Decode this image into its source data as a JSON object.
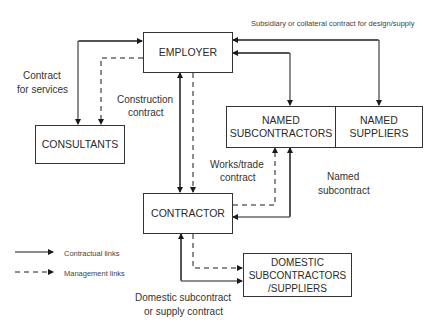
{
  "diagram": {
    "nodes": {
      "employer": "EMPLOYER",
      "consultants": "CONSULTANTS",
      "named_subcontractors": "NAMED\nSUBCONTRACTORS",
      "named_suppliers": "NAMED\nSUPPLIERS",
      "contractor": "CONTRACTOR",
      "domestic": "DOMESTIC\nSUBCONTRACTORS\n/SUPPLIERS"
    },
    "labels": {
      "subsidiary": "Subsidiary or collateral contract for design/supply",
      "contract_services_1": "Contract",
      "contract_services_2": "for services",
      "construction_1": "Construction",
      "construction_2": "contract",
      "works_1": "Works/trade",
      "works_2": "contract",
      "named_sub_1": "Named",
      "named_sub_2": "subcontract",
      "domestic_1": "Domestic subcontract",
      "domestic_2": "or supply contract"
    },
    "legend": {
      "contractual": "Contractual links",
      "management": "Management links"
    },
    "colors": {
      "line": "#1a1a1a",
      "box_border": "#333333",
      "text": "#2b2b2b"
    }
  }
}
